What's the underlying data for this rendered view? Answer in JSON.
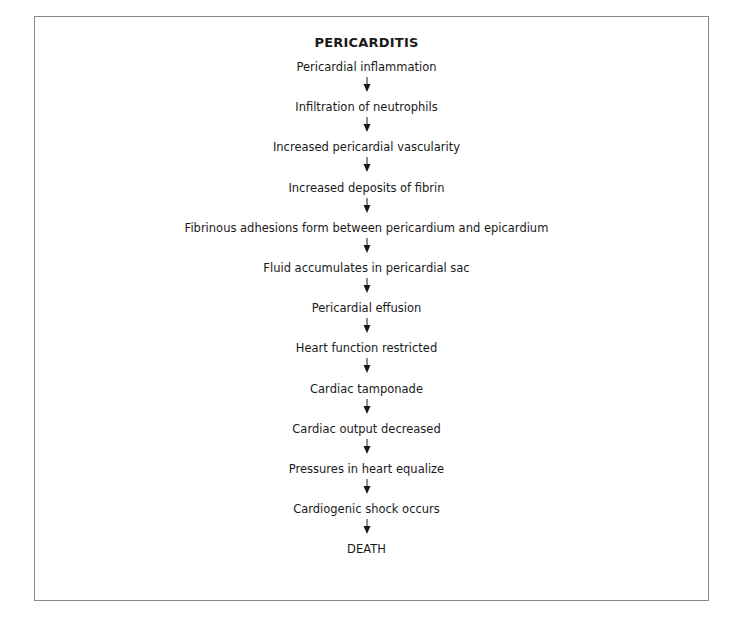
{
  "diagram": {
    "title": "PERICARDITIS",
    "type": "flowchart",
    "direction": "top-to-bottom",
    "steps": [
      "Pericardial  inflammation",
      "Infiltration of neutrophils",
      "Increased pericardial vascularity",
      "Increased deposits of fibrin",
      "Fibrinous adhesions form between pericardium and epicardium",
      "Fluid accumulates in pericardial sac",
      "Pericardial effusion",
      "Heart function restricted",
      "Cardiac tamponade",
      "Cardiac output decreased",
      "Pressures in heart equalize",
      "Cardiogenic shock occurs",
      "DEATH"
    ],
    "connector_icon": "down-arrow-icon",
    "colors": {
      "text": "#1a1a1a",
      "border": "#8a8a8a",
      "background": "#ffffff"
    }
  }
}
